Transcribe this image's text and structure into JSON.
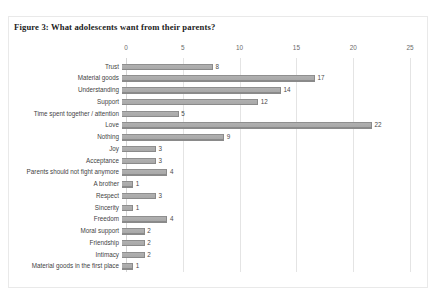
{
  "figure": {
    "title": "Figure 3: What adolescents want from their parents?"
  },
  "chart_data": {
    "type": "bar",
    "orientation": "horizontal",
    "title": "Figure 3: What adolescents want from their parents?",
    "xlabel": "",
    "ylabel": "",
    "xlim": [
      0,
      25
    ],
    "xticks": [
      0,
      5,
      10,
      15,
      20,
      25
    ],
    "grid": true,
    "legend": false,
    "data_labels": true,
    "bar_color": "#a8a8a8",
    "categories": [
      "Trust",
      "Material goods",
      "Understanding",
      "Support",
      "Time spent together / attention",
      "Love",
      "Nothing",
      "Joy",
      "Acceptance",
      "Parents should not fight anymore",
      "A brother",
      "Respect",
      "Sincerity",
      "Freedom",
      "Moral support",
      "Friendship",
      "Intimacy",
      "Material goods in the first place"
    ],
    "values": [
      8,
      17,
      14,
      12,
      5,
      22,
      9,
      3,
      3,
      4,
      1,
      3,
      1,
      4,
      2,
      2,
      2,
      1
    ]
  }
}
